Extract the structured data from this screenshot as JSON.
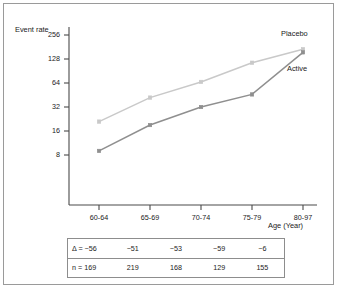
{
  "chart_data": {
    "type": "line",
    "title": "",
    "xlabel": "Age (Year)",
    "ylabel": "Event rate",
    "categories": [
      "60-64",
      "65-69",
      "70-74",
      "75-79",
      "80-97"
    ],
    "yticks": [
      8,
      16,
      32,
      64,
      128,
      256
    ],
    "ytick_labels": [
      "8",
      "16",
      "32",
      "64",
      "128",
      "256"
    ],
    "yscale": "log2",
    "ylim": [
      5.5,
      330
    ],
    "grid": false,
    "legend_position": "inline-right",
    "series": [
      {
        "name": "Placebo",
        "color": "#c9c9c9",
        "marker": "square",
        "values": [
          21,
          42,
          66,
          115,
          170
        ]
      },
      {
        "name": "Active",
        "color": "#8f8f8f",
        "marker": "square",
        "values": [
          9,
          19,
          32,
          46,
          155
        ]
      }
    ],
    "annotations": [
      {
        "text": "Placebo",
        "series": "Placebo"
      },
      {
        "text": "Active",
        "series": "Active"
      }
    ],
    "table": {
      "rows": [
        {
          "label": "Δ = −56",
          "values": [
            "−51",
            "−53",
            "−59",
            "−6"
          ]
        },
        {
          "label": "n = 169",
          "values": [
            "219",
            "168",
            "129",
            "155"
          ]
        }
      ]
    }
  },
  "colors": {
    "placebo": "#c9c9c9",
    "active": "#8f8f8f",
    "axis": "#4a4a4a",
    "frame": "#9a9a9a",
    "table_border": "#8d8d8d",
    "text": "#1a1a1a"
  }
}
